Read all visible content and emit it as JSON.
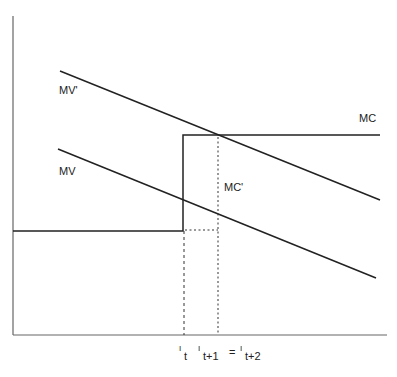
{
  "diagram": {
    "curves": {
      "mv_prime": {
        "label": "MV'"
      },
      "mv": {
        "label": "MV"
      },
      "mc": {
        "label": "MC"
      },
      "mc_prime": {
        "label": "MC'"
      }
    },
    "x_axis_labels": {
      "it_main": "I",
      "it_sub": "t",
      "it1_main": "I",
      "it1_sub": "t+1",
      "equals": "=",
      "it2_main": "I",
      "it2_sub": "t+2"
    },
    "colors": {
      "line": "#222222",
      "axis": "#555555"
    }
  }
}
